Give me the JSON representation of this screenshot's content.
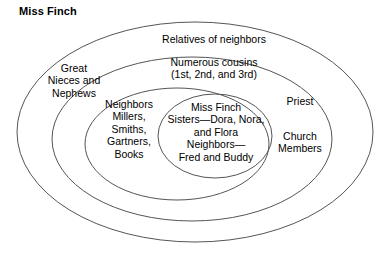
{
  "diagram": {
    "title": "Miss Finch",
    "type": "concentric-ellipse-social-network",
    "stroke_color": "#555555",
    "background_color": "#ffffff",
    "text_color": "#000000",
    "rings": [
      {
        "name": "relatives-of-neighbors",
        "level": 1,
        "label": "Relatives of neighbors"
      },
      {
        "name": "numerous-cousins",
        "level": 2,
        "label": "Numerous cousins\n(1st, 2nd, and 3rd)"
      },
      {
        "name": "great-nieces-and-nephews",
        "level": 2,
        "label": "Great\nNieces and\nNephews"
      },
      {
        "name": "priest",
        "level": 2,
        "label": "Priest"
      },
      {
        "name": "church-members",
        "level": 2,
        "label": "Church\nMembers"
      },
      {
        "name": "neighbors-list",
        "level": 3,
        "label": "Neighbors\nMillers,\nSmiths,\nGartners,\nBooks"
      },
      {
        "name": "core-inner-circle",
        "level": 4,
        "label": "Miss Finch\nSisters—Dora, Nora,\nand Flora\nNeighbors—\nFred and Buddy"
      }
    ]
  }
}
